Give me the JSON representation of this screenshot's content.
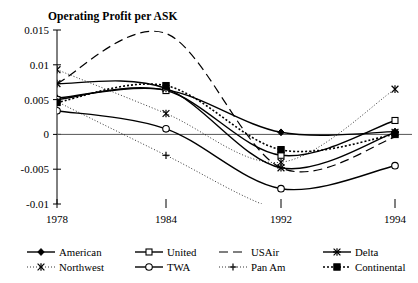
{
  "chart_data": {
    "type": "line",
    "title": "Operating Profit per ASK",
    "xlabel": "",
    "ylabel": "",
    "x": [
      1978,
      1984,
      1992,
      1994
    ],
    "tick_labels_x": [
      "1978",
      "1984",
      "1992",
      "1994"
    ],
    "tick_labels_y": [
      "0.015",
      "0.01",
      "0.005",
      "0",
      "-0.005",
      "-0.01"
    ],
    "yticks": [
      0.015,
      0.01,
      0.005,
      0,
      -0.005,
      -0.01
    ],
    "ylim": [
      -0.01,
      0.015
    ],
    "xlim": [
      1978,
      1994
    ],
    "grid": false,
    "legend_position": "bottom",
    "series": [
      {
        "name": "American",
        "marker": "filled-diamond",
        "dash": "solid",
        "values": [
          0.0052,
          0.0064,
          0.0003,
          0.0004
        ]
      },
      {
        "name": "United",
        "marker": "hollow-square",
        "dash": "solid",
        "values": [
          0.005,
          0.0063,
          -0.003,
          0.002
        ]
      },
      {
        "name": "USAir",
        "marker": "none",
        "dash": "long-dash",
        "values": [
          0.0073,
          0.0145,
          -0.0048,
          -0.0004
        ]
      },
      {
        "name": "Delta",
        "marker": "star-x",
        "dash": "solid",
        "values": [
          0.0073,
          0.0066,
          -0.0048,
          0.0003
        ]
      },
      {
        "name": "Northwest",
        "marker": "asterisk",
        "dash": "dash-dot",
        "values": [
          0.0093,
          0.003,
          -0.004,
          0.0065
        ]
      },
      {
        "name": "TWA",
        "marker": "hollow-circle",
        "dash": "solid",
        "values": [
          0.0034,
          0.0008,
          -0.0078,
          -0.0045
        ]
      },
      {
        "name": "Pan Am",
        "marker": "plus",
        "dash": "dash-dot",
        "values": [
          0.0047,
          -0.003,
          -0.011,
          -0.013
        ]
      },
      {
        "name": "Continental",
        "marker": "filled-square",
        "dash": "dotted",
        "values": [
          0.0046,
          0.007,
          -0.0022,
          0.0
        ]
      }
    ]
  },
  "legend": {
    "entries": [
      {
        "label": "American"
      },
      {
        "label": "United"
      },
      {
        "label": "USAir"
      },
      {
        "label": "Delta"
      },
      {
        "label": "Northwest"
      },
      {
        "label": "TWA"
      },
      {
        "label": "Pan Am"
      },
      {
        "label": "Continental"
      }
    ]
  }
}
